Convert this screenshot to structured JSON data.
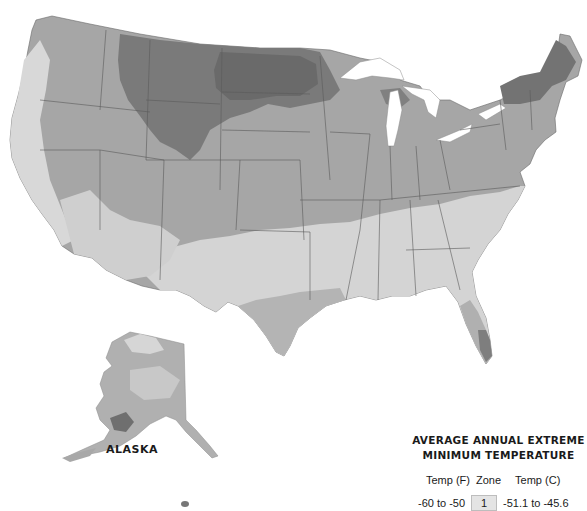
{
  "map": {
    "subject": "USDA plant hardiness zone map (grayscale)",
    "regions_labeled": [
      "ALASKA"
    ],
    "colors": {
      "background": "#ffffff",
      "zone_darkest": "#6e6e6e",
      "zone_dark": "#8a8a8a",
      "zone_mid": "#a3a3a3",
      "zone_light": "#c8c8c8",
      "zone_lightest": "#dedede",
      "water": "#ffffff",
      "borders": "#555555"
    }
  },
  "labels": {
    "alaska": "ALASKA"
  },
  "legend": {
    "title_line1": "AVERAGE ANNUAL EXTREME",
    "title_line2": "MINIMUM TEMPERATURE",
    "headers": {
      "temp_f": "Temp (F)",
      "zone": "Zone",
      "temp_c": "Temp (C)"
    },
    "rows": [
      {
        "temp_f": "-60 to -50",
        "zone": "1",
        "temp_c": "-51.1 to -45.6",
        "swatch_color": "#e4e4e4"
      }
    ]
  }
}
